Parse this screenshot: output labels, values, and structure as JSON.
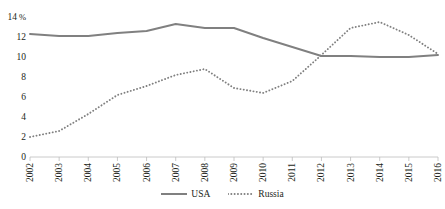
{
  "chart_data": {
    "type": "line",
    "title": "",
    "xlabel": "",
    "ylabel": "%",
    "unit_label": "%",
    "x": [
      2002,
      2003,
      2004,
      2005,
      2006,
      2007,
      2008,
      2009,
      2010,
      2011,
      2012,
      2013,
      2014,
      2015,
      2016
    ],
    "categories": [
      "2002",
      "2003",
      "2004",
      "2005",
      "2006",
      "2007",
      "2008",
      "2009",
      "2010",
      "2011",
      "2012",
      "2013",
      "2014",
      "2015",
      "2016"
    ],
    "xlim": [
      2002,
      2016
    ],
    "ylim": [
      0,
      14
    ],
    "yticks": [
      0,
      2,
      4,
      6,
      8,
      10,
      12,
      14
    ],
    "ytick_labels": [
      "0",
      "2",
      "4",
      "6",
      "8",
      "10",
      "12",
      "14"
    ],
    "grid": false,
    "legend_position": "bottom",
    "series": [
      {
        "name": "USA",
        "style": "solid",
        "color": "#808080",
        "values": [
          12.3,
          12.1,
          12.1,
          12.4,
          12.6,
          13.3,
          12.9,
          12.9,
          11.9,
          11.0,
          10.1,
          10.1,
          10.0,
          10.0,
          10.2
        ]
      },
      {
        "name": "Russia",
        "style": "dotted",
        "color": "#808080",
        "values": [
          2.0,
          2.6,
          4.3,
          6.2,
          7.1,
          8.2,
          8.8,
          6.9,
          6.4,
          7.6,
          10.2,
          12.9,
          13.5,
          12.2,
          10.3
        ]
      }
    ]
  },
  "legend": {
    "items": [
      {
        "label": "USA",
        "style": "solid"
      },
      {
        "label": "Russia",
        "style": "dotted"
      }
    ]
  }
}
